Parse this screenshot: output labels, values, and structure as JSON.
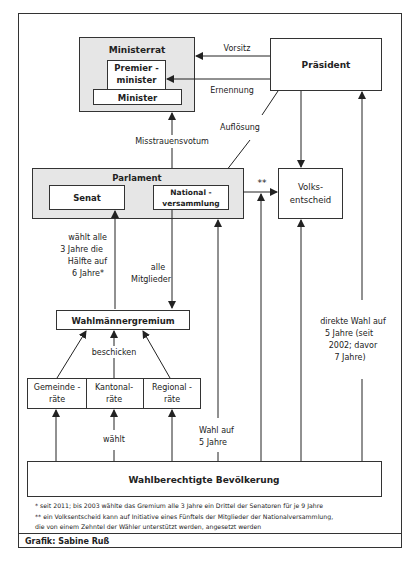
{
  "diagram": {
    "nodes": {
      "ministerrat": {
        "label": "Ministerrat"
      },
      "premierminister": {
        "line1": "Premier -",
        "line2": "minister"
      },
      "minister": {
        "label": "Minister"
      },
      "praesident": {
        "label": "Präsident"
      },
      "parlament": {
        "label": "Parlament"
      },
      "senat": {
        "label": "Senat"
      },
      "nationalversammlung": {
        "line1": "National -",
        "line2": "versammlung"
      },
      "volksentscheid": {
        "line1": "Volks-",
        "line2": "entscheid"
      },
      "wahlmaennergremium": {
        "label": "Wahlmännergremium"
      },
      "gemeinderaete": {
        "line1": "Gemeinde -",
        "line2": "räte"
      },
      "kantonalraete": {
        "line1": "Kantonal-",
        "line2": "räte"
      },
      "regionalraete": {
        "line1": "Regional -",
        "line2": "räte"
      },
      "bevoelkerung": {
        "label": "Wahlberechtigte Bevölkerung"
      }
    },
    "edges": {
      "vorsitz": "Vorsitz",
      "ernennung": "Ernennung",
      "aufloesung": "Auflösung",
      "misstrauensvotum": "Misstrauensvotum",
      "volksentscheid_marker": "**",
      "senat_wahl": [
        "wählt alle",
        "3 Jahre die",
        "Hälfte auf",
        "6 Jahre*"
      ],
      "alle_mitglieder": [
        "alle",
        "Mitglieder"
      ],
      "beschicken": "beschicken",
      "waehlt": "wählt",
      "wahl_nv": [
        "Wahl auf",
        "5 Jahre"
      ],
      "direkte_wahl": [
        "direkte Wahl auf",
        "5 Jahre (seit",
        "2002; davor",
        "7 Jahre)"
      ]
    },
    "footnotes": {
      "note1": "* seit 2011; bis 2003 wählte das Gremium alle 3 Jahre ein Drittel der Senatoren für je 9 Jahre",
      "note2a": "** ein Volksentscheid kann auf Initiative eines Fünftels der Mitglieder der Nationalversammlung,",
      "note2b": "die von einem Zehntel der Wähler unterstützt werden, angesetzt werden"
    },
    "credit": "Grafik: Sabine Ruß",
    "colors": {
      "box_fill": "#ffffff",
      "group_fill": "#e6e6e6",
      "stroke": "#333333"
    }
  }
}
